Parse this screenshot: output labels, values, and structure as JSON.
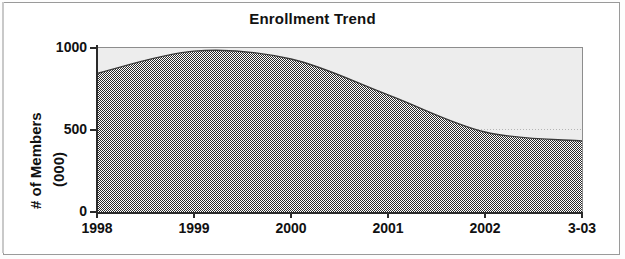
{
  "chart": {
    "title": "Enrollment Trend",
    "y_axis_title_line1": "# of Members",
    "y_axis_title_line2": "(000)",
    "y_tick_labels": [
      "1000",
      "500",
      "0"
    ],
    "x_tick_labels": [
      "1998",
      "1999",
      "2000",
      "2001",
      "2002",
      "3-03"
    ]
  },
  "colors": {
    "series_fill": "#4d4d4d",
    "plot_background": "#ededed",
    "axis": "#2a2a2a",
    "gridline": "#b4b4b4",
    "text": "#111111",
    "frame": "#9a9a9a"
  },
  "chart_data": {
    "type": "area",
    "title": "Enrollment Trend",
    "xlabel": "",
    "ylabel": "# of Members (000)",
    "categories": [
      "1998",
      "1999",
      "2000",
      "2001",
      "2002",
      "3-03"
    ],
    "x": [
      "1998",
      "1999",
      "2000",
      "2001",
      "2002",
      "3-03"
    ],
    "values": [
      840,
      975,
      927,
      710,
      485,
      430
    ],
    "series": [
      {
        "name": "# of Members (000)",
        "values": [
          840,
          975,
          927,
          710,
          485,
          430
        ]
      }
    ],
    "ylim": [
      0,
      1000
    ],
    "yticks": [
      0,
      500,
      1000
    ],
    "ytick_labels": [
      "0",
      "500",
      "1000"
    ],
    "grid": true,
    "grid_axis": "y",
    "legend": false,
    "legend_position": "none",
    "annotations": []
  }
}
